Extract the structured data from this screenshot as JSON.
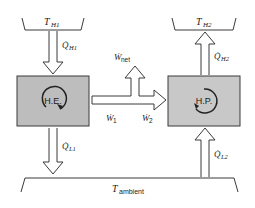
{
  "diagram": {
    "reservoirs": {
      "hot1": {
        "symbol": "T",
        "subscript": "H1"
      },
      "hot2": {
        "symbol": "T",
        "subscript": "H2"
      },
      "ambient": {
        "symbol": "T",
        "subscript": "ambient"
      }
    },
    "devices": {
      "heat_engine": {
        "label": "H.E."
      },
      "heat_pump": {
        "label": "H.P."
      }
    },
    "flows": {
      "q_h1": {
        "symbol": "Q̇",
        "subscript": "H1"
      },
      "q_l1": {
        "symbol": "Q̇",
        "subscript": "L1"
      },
      "q_h2": {
        "symbol": "Q̇",
        "subscript": "H2"
      },
      "q_l2": {
        "symbol": "Q̇",
        "subscript": "L2"
      },
      "w_1": {
        "symbol": "Ẇ",
        "subscript": "1"
      },
      "w_2": {
        "symbol": "Ẇ",
        "subscript": "2"
      },
      "w_net": {
        "symbol": "Ẇ",
        "subscript": "net"
      }
    },
    "colors": {
      "box_fill": "#c8c8c8",
      "he_box_fill": "#bdbdbd",
      "line": "#3a3a3a",
      "arrow_fill": "#ffffff"
    }
  }
}
